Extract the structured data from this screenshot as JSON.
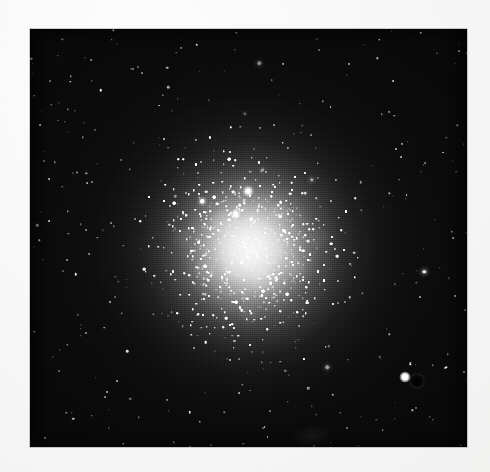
{
  "figure": {
    "kind": "photographic-halftone-print",
    "color_mode": "grayscale",
    "caption": ""
  },
  "canvas": {
    "width": 490,
    "height": 472,
    "paper_color": "#f7f7f7"
  },
  "plate": {
    "left": 30,
    "top": 29,
    "width": 437,
    "height": 418,
    "background_color": "#050505",
    "border_color": "#f1f1f0"
  },
  "chart_data": {
    "type": "heatmap",
    "title": "",
    "subtitle": "",
    "xlabel": "",
    "ylabel": "",
    "legend_position": "none",
    "grid": false,
    "center_x_frac": 0.503,
    "center_y_frac": 0.525,
    "radial_profile": {
      "radius_frac": [
        0.0,
        0.05,
        0.09,
        0.13,
        0.18,
        0.23,
        0.29,
        0.35,
        0.42,
        0.5,
        0.6,
        0.74,
        1.0
      ],
      "brightness": [
        0.97,
        0.95,
        0.9,
        0.8,
        0.66,
        0.5,
        0.36,
        0.25,
        0.16,
        0.09,
        0.04,
        0.0,
        0.0
      ]
    },
    "gray_levels": {
      "core_white": "#f2f2f2",
      "inner_halo": "#c4c4c4",
      "mid_halo": "#7c7c7c",
      "outer_halo": "#2a2a2a",
      "sky_background": "#080808"
    },
    "star_counts": {
      "core_unresolved": "saturated",
      "resolved_halo_stars": 1400,
      "sparse_field_stars": 320
    }
  },
  "features": {
    "bright_field_star": {
      "name": "bright-field-star",
      "x_frac": 0.858,
      "y_frac": 0.833,
      "relative_brightness": 1.0
    },
    "emulsion_blemish": {
      "name": "emulsion-blemish",
      "x_frac": 0.885,
      "y_frac": 0.843
    },
    "plate_smudge": {
      "name": "plate-smudge",
      "x_frac": 0.645,
      "y_frac": 0.975
    }
  }
}
